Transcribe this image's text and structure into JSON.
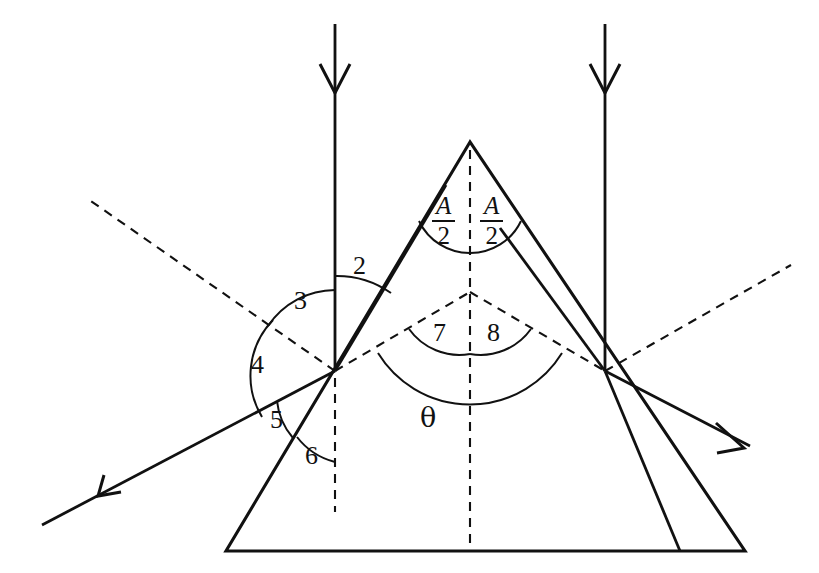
{
  "figure": {
    "kind": "optics-ray-diagram-prism",
    "background_color": "#ffffff",
    "line_color": "#111111",
    "canvas": {
      "width": 819,
      "height": 573
    }
  },
  "labels": {
    "angle_2": "2",
    "angle_3": "3",
    "angle_4": "4",
    "angle_5": "5",
    "angle_6": "6",
    "angle_7": "7",
    "angle_8": "8",
    "theta": "θ",
    "half_apex_left_numerator": "A",
    "half_apex_left_denominator": "2",
    "half_apex_right_numerator": "A",
    "half_apex_right_denominator": "2"
  },
  "geometry": {
    "prism_apex": {
      "x": 470,
      "y": 142
    },
    "prism_base_left": {
      "x": 226,
      "y": 551
    },
    "prism_base_right": {
      "x": 745,
      "y": 551
    },
    "left_incidence_point": {
      "x": 335,
      "y": 371
    },
    "right_exit_point": {
      "x": 605,
      "y": 371
    },
    "deviation_vertex": {
      "x": 470,
      "y": 292
    }
  },
  "elements": {
    "incident_ray_left_label": "incident ray arriving vertically at left face",
    "incident_ray_right_label": "vertical reference line at right face",
    "reflected_ray_label": "reflected ray exiting down-left",
    "emergent_ray_label": "emergent ray exiting down-right",
    "internal_ray_label": "refracted ray inside prism",
    "normal_left_label": "dashed normal to left face",
    "normal_right_label": "dashed normal to right face",
    "bisector_label": "dashed vertical bisector through apex"
  }
}
